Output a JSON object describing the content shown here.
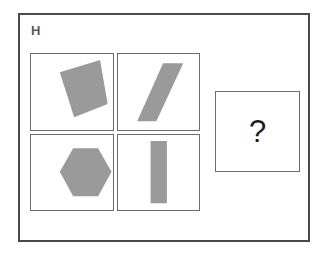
{
  "panel": {
    "label": "H",
    "background_color": "#ffffff",
    "frame_color": "#4a4a4a",
    "cell_border_color": "#6b6b6b"
  },
  "shape_fill_color": "#9a9a9a",
  "matrix": {
    "rows": 2,
    "columns": 2,
    "cells": [
      {
        "position": "top-left",
        "shape": "rotated-quadrilateral",
        "shape_label": "tilted square",
        "fill": "#9a9a9a",
        "points": "30,18 72,6 80,49 45,62"
      },
      {
        "position": "top-right",
        "shape": "slanted-parallelogram",
        "shape_label": "right-leaning parallelogram",
        "fill": "#9a9a9a",
        "points": "47,9 68,9 40,66 20,66"
      },
      {
        "position": "bottom-left",
        "shape": "hexagon",
        "shape_label": "regular hexagon",
        "fill": "#9a9a9a",
        "points": "30,36 44,13 70,13 84,36 70,60 44,60"
      },
      {
        "position": "bottom-right",
        "shape": "vertical-rectangle",
        "shape_label": "upright bar",
        "fill": "#9a9a9a",
        "points": "34,6 51,6 51,67 34,67"
      }
    ]
  },
  "answer": {
    "placeholder": "?",
    "state": "unanswered"
  }
}
